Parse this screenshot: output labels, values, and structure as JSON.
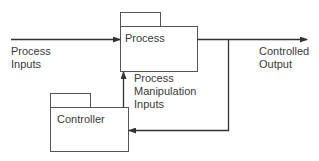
{
  "diagram": {
    "type": "control-loop-block-diagram",
    "blocks": [
      {
        "id": "process",
        "label": "Process"
      },
      {
        "id": "controller",
        "label": "Controller"
      }
    ],
    "labels": {
      "process_inputs_line1": "Process",
      "process_inputs_line2": "Inputs",
      "controlled_output_line1": "Controlled",
      "controlled_output_line2": "Output",
      "manip_line1": "Process",
      "manip_line2": "Manipulation",
      "manip_line3": "Inputs"
    },
    "edges": [
      {
        "from": "external",
        "to": "process",
        "label": "Process Inputs"
      },
      {
        "from": "process",
        "to": "external",
        "label": "Controlled Output"
      },
      {
        "from": "process",
        "to": "controller",
        "label": "feedback"
      },
      {
        "from": "controller",
        "to": "process",
        "label": "Process Manipulation Inputs"
      }
    ],
    "colors": {
      "line": "#333333",
      "box": "#555555",
      "text": "#3a3a3a"
    }
  }
}
